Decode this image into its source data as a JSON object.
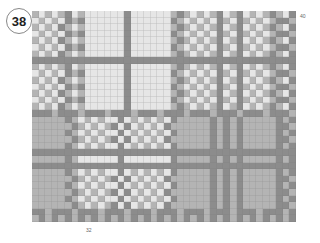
{
  "figure": {
    "number": "38",
    "columns_label": "40",
    "rows_label": "32"
  },
  "palette": {
    "0": "#e6e6e6",
    "1": "#b4b4b4",
    "2": "#8c8c8c"
  },
  "chart_data": {
    "type": "heatmap",
    "columns": 40,
    "rows": 32,
    "legend": {
      "0": "light",
      "1": "mid-gray",
      "2": "dark gray"
    },
    "grid": [
      "1010120100000020000001210101201201012102",
      "0101021200000020000002101010210210101221",
      "1010210100000020000001210101201201012102",
      "0101021200000020000002101010210210101221",
      "1010210100000020000001210101201201012102",
      "0101021200000020000002101010210210101221",
      "1010210100000020000001210101201201012102",
      "2222222222222222222222222222222222222222",
      "1010120100000020000001210101201201012102",
      "0101021200000020000002101010210210101221",
      "1010210100000020000001210101201201012102",
      "0101021200000020000002101010210210101221",
      "1010210100000020000001210101201201012102",
      "0101021200000020000002101010210210101221",
      "1010210100000020000001210101201201012102",
      "2221222122212221222122212221222122212221",
      "1111121010100201010102111112121211111212",
      "1111112101012020101021111112121211111221",
      "1111121010100201010102111112121211111212",
      "1111112101012020101021111112121211111221",
      "1111121010100201010102111112121211111212",
      "2222222222222222222222222222222222222222",
      "1111121000000200000002111112121211111212",
      "2222222222222222222222222222222222222222",
      "1111121010100201010102111112121211111212",
      "1111112101012020101021111112121211111221",
      "1111121010100201010102111112121211111212",
      "1111112101012020101021111112121211111221",
      "1111121010100201010102111112121211111212",
      "1111112101012020101021111112121211111221",
      "2212221222122212221222122212221222122212",
      "1212121212121212121212121212121212121212"
    ]
  }
}
